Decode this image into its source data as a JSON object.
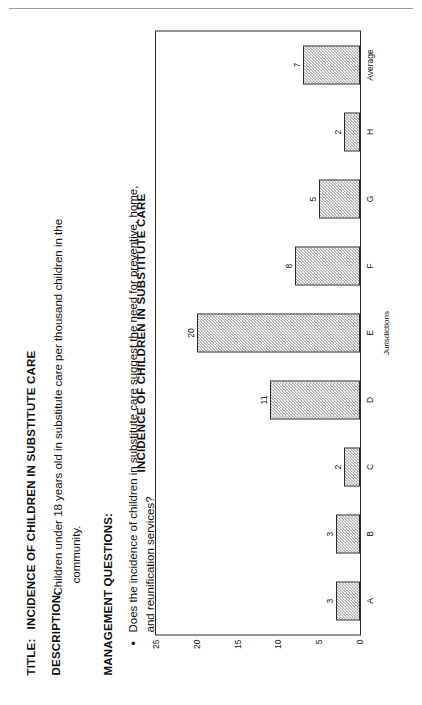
{
  "document": {
    "title_key": "TITLE:",
    "title_value": "INCIDENCE OF CHILDREN IN SUBSTITUTE CARE",
    "description_key": "DESCRIPTION:",
    "description_value_line1": "Children under 18 years old in substitute care per thousand children in the",
    "description_value_line2": "community.",
    "management_questions_heading": "MANAGEMENT QUESTIONS:",
    "bullet_marker": "•",
    "bullet_line1": "Does the incidence of children in substitute care suggest the need for preventive, home,",
    "bullet_line2": "and reunification services?"
  },
  "chart_data": {
    "type": "bar",
    "title": "INCIDENCE OF CHILDREN IN SUBSTITUTE CARE",
    "xlabel": "Jurisdictions",
    "ylabel": "Children per thousand",
    "categories": [
      "A",
      "B",
      "C",
      "D",
      "E",
      "F",
      "G",
      "H",
      "Average"
    ],
    "values": [
      3,
      3,
      2,
      11,
      20,
      8,
      5,
      2,
      7
    ],
    "value_labels": [
      "3",
      "3",
      "2",
      "11",
      "20",
      "8",
      "5",
      "2",
      "7"
    ],
    "yticks": [
      25,
      20,
      15,
      10,
      5,
      0
    ],
    "ytick_labels": [
      "25",
      "20",
      "15",
      "10",
      "5",
      "0"
    ],
    "ylim": [
      0,
      25
    ],
    "grid": false,
    "legend": false,
    "bar_fill": "#8c8c8c",
    "bar_border": "#2b2b2b",
    "frame_color": "#2b2b2b"
  }
}
